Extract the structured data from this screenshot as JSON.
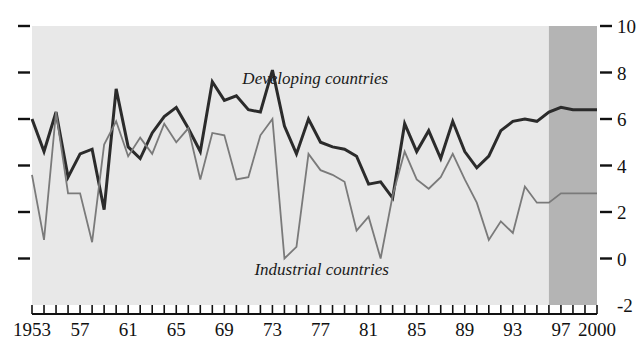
{
  "chart_data": {
    "type": "line",
    "title": "",
    "subtitle": "",
    "xlabel": "",
    "ylabel": "",
    "xlim": [
      1953,
      2000
    ],
    "ylim": [
      -2,
      10
    ],
    "grid": false,
    "legend_position": "inline-annotation",
    "y_ticks": [
      -2,
      0,
      2,
      4,
      6,
      8,
      10
    ],
    "y_tick_labels": [
      "-2",
      "0",
      "2",
      "4",
      "6",
      "8",
      "10"
    ],
    "y_axis_side": "both",
    "x_ticks": [
      1953,
      1954,
      1955,
      1956,
      1957,
      1958,
      1959,
      1960,
      1961,
      1962,
      1963,
      1964,
      1965,
      1966,
      1967,
      1968,
      1969,
      1970,
      1971,
      1972,
      1973,
      1974,
      1975,
      1976,
      1977,
      1978,
      1979,
      1980,
      1981,
      1982,
      1983,
      1984,
      1985,
      1986,
      1987,
      1988,
      1989,
      1990,
      1991,
      1992,
      1993,
      1994,
      1995,
      1996,
      1997,
      1998,
      1999,
      2000
    ],
    "x_tick_labels": [
      "1953",
      "",
      "",
      "",
      "57",
      "",
      "",
      "",
      "61",
      "",
      "",
      "",
      "65",
      "",
      "",
      "",
      "69",
      "",
      "",
      "",
      "73",
      "",
      "",
      "",
      "77",
      "",
      "",
      "",
      "81",
      "",
      "",
      "",
      "85",
      "",
      "",
      "",
      "89",
      "",
      "",
      "",
      "93",
      "",
      "",
      "",
      "97",
      "",
      "",
      "2000"
    ],
    "x_labeled_ticks": [
      {
        "year": 1953,
        "label": "1953"
      },
      {
        "year": 1957,
        "label": "57"
      },
      {
        "year": 1961,
        "label": "61"
      },
      {
        "year": 1965,
        "label": "65"
      },
      {
        "year": 1969,
        "label": "69"
      },
      {
        "year": 1973,
        "label": "73"
      },
      {
        "year": 1977,
        "label": "77"
      },
      {
        "year": 1981,
        "label": "81"
      },
      {
        "year": 1985,
        "label": "85"
      },
      {
        "year": 1989,
        "label": "89"
      },
      {
        "year": 1993,
        "label": "93"
      },
      {
        "year": 1997,
        "label": "97"
      },
      {
        "year": 2000,
        "label": "2000"
      }
    ],
    "shaded_region": {
      "label": "projection",
      "start_year": 1996,
      "end_year": 2000,
      "color": "#b4b4b4"
    },
    "plot_background_color": "#e8e8e8",
    "series": [
      {
        "name": "Developing countries",
        "color": "#2b2b2b",
        "stroke_width": 3.0,
        "annotation": "Developing countries",
        "annotation_x": 1970.5,
        "annotation_y": 7.5,
        "x": [
          1953,
          1954,
          1955,
          1956,
          1957,
          1958,
          1959,
          1960,
          1961,
          1962,
          1963,
          1964,
          1965,
          1966,
          1967,
          1968,
          1969,
          1970,
          1971,
          1972,
          1973,
          1974,
          1975,
          1976,
          1977,
          1978,
          1979,
          1980,
          1981,
          1982,
          1983,
          1984,
          1985,
          1986,
          1987,
          1988,
          1989,
          1990,
          1991,
          1992,
          1993,
          1994,
          1995,
          1996,
          1997,
          1998,
          1999,
          2000
        ],
        "values": [
          6.0,
          4.6,
          6.3,
          3.5,
          4.5,
          4.7,
          2.1,
          7.3,
          4.8,
          4.3,
          5.4,
          6.1,
          6.5,
          5.6,
          4.6,
          7.6,
          6.8,
          7.0,
          6.4,
          6.3,
          8.1,
          5.7,
          4.5,
          6.0,
          5.0,
          4.8,
          4.7,
          4.4,
          3.2,
          3.3,
          2.6,
          5.8,
          4.6,
          5.5,
          4.3,
          5.9,
          4.6,
          3.9,
          4.4,
          5.5,
          5.9,
          6.0,
          5.9,
          6.3,
          6.5,
          6.4,
          6.4,
          6.4
        ]
      },
      {
        "name": "Industrial countries",
        "color": "#7a7a7a",
        "stroke_width": 1.8,
        "annotation": "Industrial countries",
        "annotation_x": 1971.5,
        "annotation_y": -0.7,
        "x": [
          1953,
          1954,
          1955,
          1956,
          1957,
          1958,
          1959,
          1960,
          1961,
          1962,
          1963,
          1964,
          1965,
          1966,
          1967,
          1968,
          1969,
          1970,
          1971,
          1972,
          1973,
          1974,
          1975,
          1976,
          1977,
          1978,
          1979,
          1980,
          1981,
          1982,
          1983,
          1984,
          1985,
          1986,
          1987,
          1988,
          1989,
          1990,
          1991,
          1992,
          1993,
          1994,
          1995,
          1996,
          1997,
          1998,
          1999,
          2000
        ],
        "values": [
          3.6,
          0.8,
          6.3,
          2.8,
          2.8,
          0.7,
          4.9,
          5.9,
          4.4,
          5.2,
          4.5,
          5.8,
          5.0,
          5.6,
          3.4,
          5.4,
          5.3,
          3.4,
          3.5,
          5.3,
          6.0,
          0.0,
          0.5,
          4.5,
          3.8,
          3.6,
          3.3,
          1.2,
          1.8,
          0.0,
          2.7,
          4.6,
          3.4,
          3.0,
          3.5,
          4.5,
          3.4,
          2.4,
          0.8,
          1.6,
          1.1,
          3.1,
          2.4,
          2.4,
          2.8,
          2.8,
          2.8,
          2.8
        ]
      }
    ]
  },
  "annotations": {
    "developing_label": "Developing countries",
    "industrial_label": "Industrial countries"
  }
}
